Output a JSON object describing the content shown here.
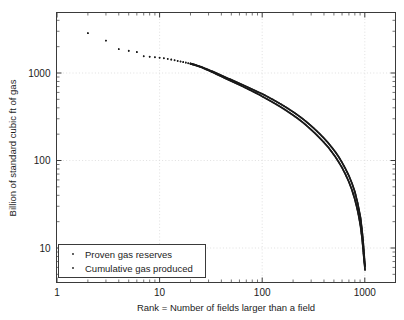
{
  "chart_data": {
    "type": "scatter",
    "title": "",
    "xlabel": "Rank = Number of fields larger than a field",
    "ylabel": "Billion of standard cubic ft of gas",
    "xscale": "log",
    "yscale": "log",
    "xlim": [
      1,
      2000
    ],
    "ylim": [
      4,
      4000
    ],
    "xticks": [
      1,
      10,
      100,
      1000
    ],
    "xtick_labels": [
      "1",
      "10",
      "100",
      "1000"
    ],
    "yticks": [
      10,
      100,
      1000
    ],
    "ytick_labels": [
      "10",
      "100",
      "1000"
    ],
    "grid": true,
    "grid_style": "dotted",
    "grid_color": "#d8d8d8",
    "axis_color": "#3a3a3a",
    "marker": "dot",
    "legend_position": "lower left",
    "series": [
      {
        "name": "Proven gas reserves",
        "color": "#1a1a1a",
        "points": [
          [
            2,
            2850
          ],
          [
            3,
            2350
          ],
          [
            4,
            1880
          ],
          [
            5,
            1800
          ],
          [
            6,
            1740
          ],
          [
            7,
            1560
          ],
          [
            8,
            1540
          ],
          [
            9,
            1520
          ],
          [
            10,
            1500
          ],
          [
            11,
            1480
          ],
          [
            12,
            1455
          ],
          [
            13,
            1430
          ],
          [
            14,
            1405
          ],
          [
            15,
            1380
          ],
          [
            16,
            1360
          ],
          [
            17,
            1340
          ],
          [
            18,
            1320
          ],
          [
            19,
            1300
          ],
          [
            20,
            1285
          ],
          [
            21,
            1265
          ],
          [
            22,
            1245
          ],
          [
            23,
            1225
          ],
          [
            24,
            1205
          ],
          [
            25,
            1185
          ],
          [
            26,
            1165
          ],
          [
            27,
            1145
          ],
          [
            28,
            1125
          ],
          [
            29,
            1105
          ],
          [
            30,
            1090
          ],
          [
            32,
            1055
          ],
          [
            34,
            1025
          ],
          [
            36,
            995
          ],
          [
            38,
            968
          ],
          [
            40,
            942
          ],
          [
            44,
            895
          ],
          [
            48,
            855
          ],
          [
            52,
            820
          ],
          [
            56,
            790
          ],
          [
            60,
            762
          ],
          [
            66,
            725
          ],
          [
            72,
            692
          ],
          [
            78,
            662
          ],
          [
            84,
            635
          ],
          [
            90,
            610
          ],
          [
            96,
            590
          ],
          [
            100,
            578
          ],
          [
            110,
            545
          ],
          [
            120,
            515
          ],
          [
            130,
            490
          ],
          [
            140,
            466
          ],
          [
            150,
            445
          ],
          [
            165,
            416
          ],
          [
            180,
            390
          ],
          [
            200,
            360
          ],
          [
            220,
            333
          ],
          [
            240,
            309
          ],
          [
            260,
            287
          ],
          [
            280,
            267
          ],
          [
            300,
            249
          ],
          [
            330,
            225
          ],
          [
            360,
            204
          ],
          [
            400,
            180
          ],
          [
            440,
            159
          ],
          [
            480,
            140
          ],
          [
            520,
            124
          ],
          [
            560,
            109
          ],
          [
            600,
            95
          ],
          [
            650,
            80
          ],
          [
            700,
            67
          ],
          [
            750,
            55
          ],
          [
            800,
            44
          ],
          [
            850,
            33
          ],
          [
            880,
            27
          ],
          [
            910,
            22
          ],
          [
            940,
            16
          ],
          [
            960,
            12.5
          ],
          [
            980,
            9.2
          ],
          [
            995,
            7.2
          ],
          [
            1005,
            6.2
          ]
        ]
      },
      {
        "name": "Cumulative gas produced",
        "color": "#1a1a1a",
        "points": [
          [
            2,
            2850
          ],
          [
            3,
            2350
          ],
          [
            4,
            1870
          ],
          [
            5,
            1790
          ],
          [
            6,
            1730
          ],
          [
            7,
            1550
          ],
          [
            8,
            1530
          ],
          [
            9,
            1510
          ],
          [
            10,
            1490
          ],
          [
            11,
            1470
          ],
          [
            12,
            1445
          ],
          [
            13,
            1420
          ],
          [
            14,
            1395
          ],
          [
            15,
            1370
          ],
          [
            16,
            1350
          ],
          [
            17,
            1330
          ],
          [
            18,
            1310
          ],
          [
            19,
            1290
          ],
          [
            20,
            1272
          ],
          [
            21,
            1252
          ],
          [
            22,
            1232
          ],
          [
            23,
            1212
          ],
          [
            24,
            1192
          ],
          [
            25,
            1172
          ],
          [
            26,
            1152
          ],
          [
            27,
            1130
          ],
          [
            28,
            1108
          ],
          [
            29,
            1088
          ],
          [
            30,
            1070
          ],
          [
            32,
            1032
          ],
          [
            34,
            1000
          ],
          [
            36,
            968
          ],
          [
            38,
            940
          ],
          [
            40,
            914
          ],
          [
            44,
            866
          ],
          [
            48,
            826
          ],
          [
            52,
            791
          ],
          [
            56,
            760
          ],
          [
            60,
            732
          ],
          [
            66,
            694
          ],
          [
            72,
            660
          ],
          [
            78,
            630
          ],
          [
            84,
            603
          ],
          [
            90,
            578
          ],
          [
            96,
            557
          ],
          [
            100,
            540
          ],
          [
            110,
            508
          ],
          [
            120,
            480
          ],
          [
            130,
            455
          ],
          [
            140,
            432
          ],
          [
            150,
            412
          ],
          [
            165,
            384
          ],
          [
            180,
            359
          ],
          [
            200,
            330
          ],
          [
            220,
            305
          ],
          [
            240,
            282
          ],
          [
            260,
            261
          ],
          [
            280,
            242
          ],
          [
            300,
            225
          ],
          [
            330,
            203
          ],
          [
            360,
            183
          ],
          [
            400,
            161
          ],
          [
            440,
            142
          ],
          [
            480,
            124
          ],
          [
            520,
            109
          ],
          [
            560,
            95
          ],
          [
            600,
            83
          ],
          [
            650,
            69
          ],
          [
            700,
            57
          ],
          [
            750,
            46
          ],
          [
            800,
            36
          ],
          [
            850,
            27
          ],
          [
            880,
            22
          ],
          [
            910,
            17.5
          ],
          [
            940,
            13
          ],
          [
            960,
            10
          ],
          [
            980,
            7.6
          ],
          [
            995,
            6.4
          ],
          [
            1005,
            5.6
          ]
        ]
      }
    ],
    "legend": [
      {
        "label": "Proven gas reserves",
        "marker": "dot",
        "color": "#1a1a1a"
      },
      {
        "label": "Cumulative gas produced",
        "marker": "dot",
        "color": "#1a1a1a"
      }
    ]
  }
}
